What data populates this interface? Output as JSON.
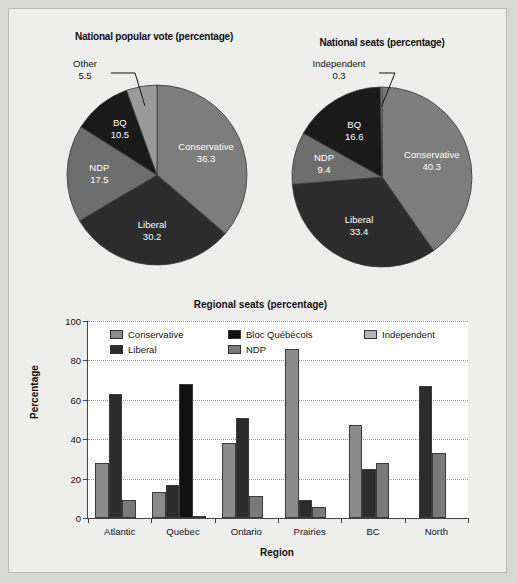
{
  "chart_data": [
    {
      "type": "pie",
      "title": "National popular vote (percentage)",
      "labels": [
        "Conservative",
        "Liberal",
        "NDP",
        "BQ",
        "Other"
      ],
      "values": [
        36.3,
        30.2,
        17.5,
        10.5,
        5.5
      ],
      "value_labels": [
        "36.3",
        "30.2",
        "17.5",
        "10.5",
        "5.5"
      ],
      "colors": [
        "#7d7d7d",
        "#2c2c2c",
        "#6e6e6e",
        "#1a1a1a",
        "#9a9a9a"
      ],
      "callout": [
        "Other"
      ],
      "legend": "none"
    },
    {
      "type": "pie",
      "title": "National seats (percentage)",
      "labels": [
        "Conservative",
        "Liberal",
        "NDP",
        "BQ",
        "Independent"
      ],
      "values": [
        40.3,
        33.4,
        9.4,
        16.6,
        0.3
      ],
      "value_labels": [
        "40.3",
        "33.4",
        "9.4",
        "16.6",
        "0.3"
      ],
      "colors": [
        "#7d7d7d",
        "#2c2c2c",
        "#6e6e6e",
        "#1a1a1a",
        "#9a9a9a"
      ],
      "callout": [
        "Independent"
      ],
      "legend": "none"
    },
    {
      "type": "bar",
      "title": "Regional seats (percentage)",
      "xlabel": "Region",
      "ylabel": "Percentage",
      "categories": [
        "Atlantic",
        "Quebec",
        "Ontario",
        "Prairies",
        "BC",
        "North"
      ],
      "ylim": [
        0,
        100
      ],
      "yticks": [
        0,
        20,
        40,
        60,
        80,
        100
      ],
      "grid": true,
      "legend_position": "upper-left-inside",
      "series": [
        {
          "name": "Conservative",
          "color": "#8a8a8a",
          "values": [
            28,
            13,
            38,
            86,
            47,
            0
          ]
        },
        {
          "name": "Liberal",
          "color": "#2c2c2c",
          "values": [
            63,
            17,
            51,
            9,
            25,
            67
          ]
        },
        {
          "name": "Bloc Québécois",
          "color": "#111111",
          "values": [
            0,
            68,
            0,
            0,
            0,
            0
          ]
        },
        {
          "name": "NDP",
          "color": "#7a7a7a",
          "values": [
            9,
            0,
            11,
            5.5,
            28,
            33
          ]
        },
        {
          "name": "Independent",
          "color": "#b5b5b5",
          "values": [
            0,
            1,
            0,
            0,
            0,
            0
          ]
        }
      ]
    }
  ],
  "pie_left": {
    "title": "National popular vote (percentage)",
    "slices": [
      {
        "name": "Conservative",
        "value": "36.3"
      },
      {
        "name": "Liberal",
        "value": "30.2"
      },
      {
        "name": "NDP",
        "value": "17.5"
      },
      {
        "name": "BQ",
        "value": "10.5"
      },
      {
        "name": "Other",
        "value": "5.5"
      }
    ]
  },
  "pie_right": {
    "title": "National seats (percentage)",
    "slices": [
      {
        "name": "Conservative",
        "value": "40.3"
      },
      {
        "name": "Liberal",
        "value": "33.4"
      },
      {
        "name": "NDP",
        "value": "9.4"
      },
      {
        "name": "BQ",
        "value": "16.6"
      },
      {
        "name": "Independent",
        "value": "0.3"
      }
    ]
  },
  "bar_chart": {
    "title": "Regional seats (percentage)",
    "xlabel": "Region",
    "ylabel": "Percentage",
    "categories": [
      "Atlantic",
      "Quebec",
      "Ontario",
      "Prairies",
      "BC",
      "North"
    ],
    "yticks": [
      "0",
      "20",
      "40",
      "60",
      "80",
      "100"
    ],
    "legend": [
      {
        "label": "Conservative"
      },
      {
        "label": "Bloc Québécois"
      },
      {
        "label": "Independent"
      },
      {
        "label": "Liberal"
      },
      {
        "label": "NDP"
      }
    ]
  }
}
